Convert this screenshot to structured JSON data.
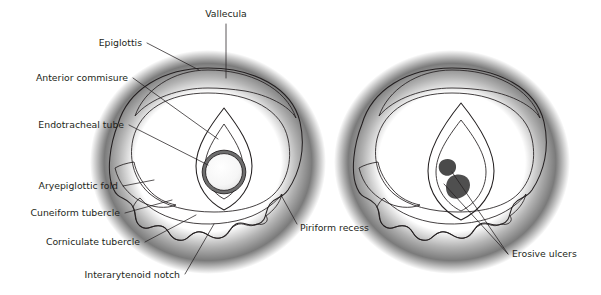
{
  "figure": {
    "width": 601,
    "height": 295,
    "background": "#ffffff"
  },
  "colors": {
    "ink": "#231f20",
    "tissue_light": "#f2f2f2",
    "tissue_mid": "#d9d9d9",
    "tissue_shade": "#b3b3b3",
    "glottis_dark": "#6b6b6b",
    "glottis_darker": "#595959",
    "tube_fill": "#f7f7f7",
    "tube_ring": "#767676",
    "halo": "#3a3a3a"
  },
  "panels": [
    {
      "id": "left-panel",
      "name": "larynx-with-endotracheal-tube",
      "caption": "",
      "has_tube": true
    },
    {
      "id": "right-panel",
      "name": "larynx-with-erosive-ulcers",
      "caption": "",
      "has_tube": false
    }
  ],
  "labels": [
    {
      "id": "vallecula",
      "text": "Vallecula",
      "x": 226,
      "y": 17,
      "anchor": "middle"
    },
    {
      "id": "epiglottis",
      "text": "Epiglottis",
      "x": 142,
      "y": 46,
      "anchor": "end"
    },
    {
      "id": "anterior-commisure",
      "text": "Anterior commisure",
      "x": 128,
      "y": 81,
      "anchor": "end"
    },
    {
      "id": "endotracheal-tube",
      "text": "Endotracheal tube",
      "x": 124,
      "y": 128,
      "anchor": "end"
    },
    {
      "id": "aryepiglottic-fold",
      "text": "Aryepiglottic fold",
      "x": 118,
      "y": 189,
      "anchor": "end"
    },
    {
      "id": "cuneiform-tubercle",
      "text": "Cuneiform tubercle",
      "x": 120,
      "y": 216,
      "anchor": "end"
    },
    {
      "id": "corniculate-tubercle",
      "text": "Corniculate tubercle",
      "x": 140,
      "y": 245,
      "anchor": "end"
    },
    {
      "id": "interarytenoid-notch",
      "text": "Interarytenoid notch",
      "x": 180,
      "y": 278,
      "anchor": "end"
    },
    {
      "id": "piriform-recess",
      "text": "Piriform recess",
      "x": 300,
      "y": 231,
      "anchor": "start"
    },
    {
      "id": "erosive-ulcers",
      "text": "Erosive ulcers",
      "x": 512,
      "y": 257,
      "anchor": "start"
    }
  ],
  "leaders": [
    {
      "id": "leader-vallecula",
      "for": "vallecula",
      "path": "M 226 24 L 226 78"
    },
    {
      "id": "leader-epiglottis",
      "for": "epiglottis",
      "path": "M 147 43 L 199 70"
    },
    {
      "id": "leader-anterior-commisure",
      "for": "anterior-commisure",
      "path": "M 133 78 L 218 139"
    },
    {
      "id": "leader-endotracheal-tube",
      "for": "endotracheal-tube",
      "path": "M 129 125 L 208 165"
    },
    {
      "id": "leader-aryepiglottic-fold",
      "for": "aryepiglottic-fold",
      "path": "M 123 186 L 154 180"
    },
    {
      "id": "leader-cuneiform-tubercle",
      "for": "cuneiform-tubercle",
      "path": "M 125 213 L 172 200"
    },
    {
      "id": "leader-corniculate-tubercle",
      "for": "corniculate-tubercle",
      "path": "M 145 242 L 196 215"
    },
    {
      "id": "leader-interarytenoid-notch",
      "for": "interarytenoid-notch",
      "path": "M 185 274 L 214 224"
    },
    {
      "id": "leader-piriform-recess",
      "for": "piriform-recess",
      "path": "M 297 224 L 281 195"
    },
    {
      "id": "leader-erosive-ulcers-a",
      "for": "erosive-ulcers",
      "path": "M 508 254 L 444 184"
    },
    {
      "id": "leader-erosive-ulcers-b",
      "for": "erosive-ulcers",
      "path": "M 508 254 L 452 172"
    }
  ]
}
